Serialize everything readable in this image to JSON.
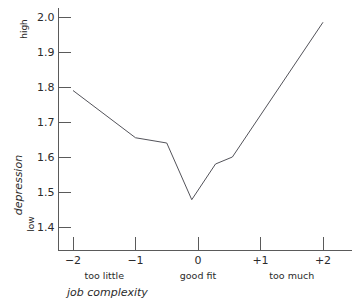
{
  "chart_data": {
    "type": "line",
    "title": "",
    "subtitle": "",
    "xlabel": "job complexity",
    "ylabel": "depression",
    "ylim": [
      1.35,
      2.03
    ],
    "xlim": [
      -2.35,
      2.3
    ],
    "grid": false,
    "legend": null,
    "y_axis": {
      "ticks": [
        1.4,
        1.5,
        1.6,
        1.7,
        1.8,
        1.9,
        2.0
      ],
      "tick_labels": [
        "1.4",
        "1.5",
        "1.6",
        "1.7",
        "1.8",
        "1.9",
        "2.0"
      ],
      "low_label": "low",
      "high_label": "high"
    },
    "x_axis": {
      "ticks": [
        -2,
        -1,
        0,
        1,
        2
      ],
      "tick_labels": [
        "−2",
        "−1",
        "0",
        "+1",
        "+2"
      ],
      "category_labels": [
        {
          "at": -1.5,
          "text": "too little"
        },
        {
          "at": 0,
          "text": "good fit"
        },
        {
          "at": 1.5,
          "text": "too much"
        }
      ]
    },
    "series": [
      {
        "name": "depression",
        "color": "#53535a",
        "x": [
          -2.0,
          -1.0,
          -0.5,
          -0.1,
          0.28,
          0.55,
          2.0
        ],
        "values": [
          1.79,
          1.655,
          1.64,
          1.478,
          1.58,
          1.6,
          1.985
        ]
      }
    ]
  }
}
